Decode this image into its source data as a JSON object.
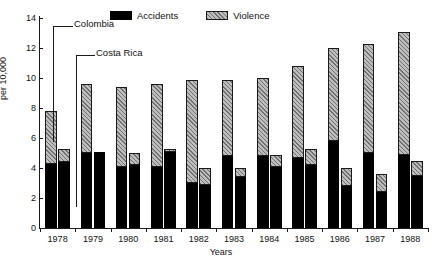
{
  "chart_data": {
    "type": "bar",
    "subtype": "grouped-stacked",
    "title": "",
    "xlabel": "Years",
    "ylabel": "per 10,000",
    "ylim": [
      0,
      14
    ],
    "ytick_step": 2,
    "yticks": [
      "0",
      "2",
      "4",
      "6",
      "8",
      "10",
      "12",
      "14"
    ],
    "grid": false,
    "legend_position": "top-center",
    "categories": [
      "1978",
      "1979",
      "1980",
      "1981",
      "1982",
      "1983",
      "1984",
      "1985",
      "1986",
      "1987",
      "1988"
    ],
    "groups": [
      "Colombia",
      "Costa Rica"
    ],
    "stack_order": [
      "Accidents",
      "Violence"
    ],
    "legend": [
      {
        "label": "Accidents",
        "color": "#000000",
        "pattern": "solid"
      },
      {
        "label": "Violence",
        "color": "#bdbdbd",
        "pattern": "hatch-45"
      }
    ],
    "annotations": [
      {
        "text": "Colombia",
        "points_to": "1978 Colombia bar"
      },
      {
        "text": "Costa Rica",
        "points_to": "1978 Costa Rica bar"
      }
    ],
    "series": [
      {
        "name": "Colombia",
        "stacks": [
          {
            "name": "Accidents",
            "values": [
              4.3,
              5.0,
              4.1,
              4.1,
              3.0,
              4.8,
              4.8,
              4.7,
              5.8,
              5.0,
              4.9
            ]
          },
          {
            "name": "Violence",
            "values": [
              3.5,
              4.6,
              5.3,
              5.5,
              6.9,
              5.1,
              5.2,
              6.1,
              6.2,
              7.3,
              8.2
            ]
          },
          {
            "name": "Total",
            "values": [
              7.8,
              9.6,
              9.4,
              9.6,
              9.9,
              9.9,
              10.0,
              10.8,
              12.0,
              12.3,
              13.1
            ]
          }
        ]
      },
      {
        "name": "Costa Rica",
        "stacks": [
          {
            "name": "Accidents",
            "values": [
              4.4,
              5.1,
              4.2,
              5.1,
              2.9,
              3.4,
              4.1,
              4.2,
              2.8,
              2.4,
              3.5
            ]
          },
          {
            "name": "Violence",
            "values": [
              0.9,
              0.0,
              0.8,
              0.2,
              1.1,
              0.6,
              0.8,
              1.1,
              1.2,
              1.2,
              1.0
            ]
          },
          {
            "name": "Total",
            "values": [
              5.3,
              5.1,
              5.0,
              5.3,
              4.0,
              4.0,
              4.9,
              5.3,
              4.0,
              3.6,
              4.5
            ]
          }
        ]
      }
    ]
  }
}
